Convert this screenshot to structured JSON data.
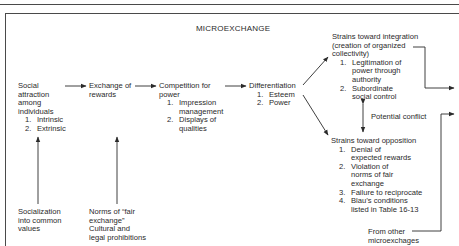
{
  "diagram": {
    "title": "MICROEXCHANGE",
    "nodes": {
      "social_attraction": {
        "lines": [
          "Social",
          "attraction",
          "among",
          "individuals"
        ],
        "items": [
          {
            "n": "1.",
            "text": "Intrinsic"
          },
          {
            "n": "2.",
            "text": "Extrinsic"
          }
        ]
      },
      "exchange": {
        "lines": [
          "Exchange of",
          "rewards"
        ]
      },
      "competition": {
        "lines": [
          "Competition for",
          "power"
        ],
        "items": [
          {
            "n": "1.",
            "text": "Impression",
            "text2": "management"
          },
          {
            "n": "2.",
            "text": "Displays of",
            "text2": "qualities"
          }
        ]
      },
      "differentiation": {
        "lines": [
          "Differentiation"
        ],
        "items": [
          {
            "n": "1.",
            "text": "Esteem"
          },
          {
            "n": "2.",
            "text": "Power"
          }
        ]
      },
      "integration": {
        "lines": [
          "Strains toward integration",
          "(creation of organized",
          "collectivity)"
        ],
        "items": [
          {
            "n": "1.",
            "text": "Legitimation of",
            "text2": "power through",
            "text3": "authority"
          },
          {
            "n": "2.",
            "text": "Subordinate",
            "text2": "social control"
          }
        ]
      },
      "potential_conflict": {
        "label": "Potential conflict"
      },
      "opposition": {
        "lines": [
          "Strains toward opposition"
        ],
        "items": [
          {
            "n": "1.",
            "text": "Denial of",
            "text2": "expected rewards"
          },
          {
            "n": "2.",
            "text": "Violation of",
            "text2": "norms of fair",
            "text3": "exchange"
          },
          {
            "n": "3.",
            "text": "Failure to reciprocate"
          },
          {
            "n": "4.",
            "text": "Blau’s conditions",
            "text2": "listed in Table 16-13"
          }
        ]
      },
      "socialization": {
        "lines": [
          "Socialization",
          "into common",
          "values"
        ]
      },
      "norms": {
        "lines": [
          "Norms of “fair",
          "exchange”",
          "Cultural and",
          "legal prohibitions"
        ]
      },
      "other_microexchanges": {
        "lines": [
          "From other",
          "microexchages"
        ]
      }
    },
    "edges": [
      {
        "from": "social_attraction",
        "to": "exchange"
      },
      {
        "from": "exchange",
        "to": "competition"
      },
      {
        "from": "competition",
        "to": "differentiation"
      },
      {
        "from": "differentiation",
        "to": "integration"
      },
      {
        "from": "differentiation",
        "to": "opposition"
      },
      {
        "from": "integration",
        "to": "opposition",
        "label": "Potential conflict",
        "bidirectional": true
      },
      {
        "from": "socialization",
        "to": "social_attraction"
      },
      {
        "from": "norms",
        "to": "exchange"
      },
      {
        "from": "integration",
        "to": "off-page-right"
      },
      {
        "from": "other_microexchanges",
        "to": "off-page-right"
      }
    ],
    "colors": {
      "ink": "#2a2a2a",
      "rule": "#4a4a4a",
      "background": "#ffffff"
    }
  }
}
